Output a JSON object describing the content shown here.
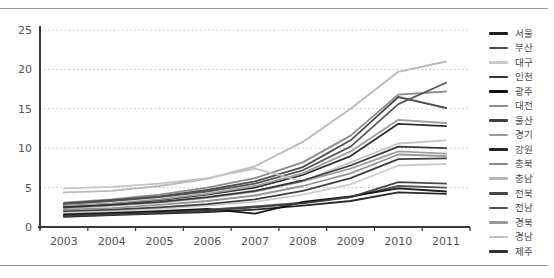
{
  "page": {
    "background": "#ffffff",
    "top_rule_color": "#9a9a9a",
    "bottom_rule_color": "#8d8d8d",
    "axis_color": "#3a3a3a",
    "gridline_color": "#c3c3c3",
    "tick_label_color": "#555555"
  },
  "chart_data": {
    "type": "line",
    "title": "",
    "xlabel": "",
    "ylabel": "",
    "x": [
      "2003",
      "2004",
      "2005",
      "2006",
      "2007",
      "2008",
      "2009",
      "2010",
      "2011"
    ],
    "ylim": [
      0,
      25
    ],
    "yticks": [
      "0",
      "5",
      "10",
      "15",
      "20",
      "25"
    ],
    "grid": "horizontal-dotted",
    "legend_position": "right",
    "series": [
      {
        "id": "seoul",
        "name": "서울",
        "color": "#1f1f1f",
        "values": [
          1.3,
          1.5,
          1.7,
          1.9,
          2.2,
          2.7,
          3.3,
          4.4,
          4.2
        ]
      },
      {
        "id": "busan",
        "name": "부산",
        "color": "#4a4a4a",
        "values": [
          1.5,
          1.7,
          1.9,
          2.2,
          2.6,
          3.1,
          3.8,
          5.2,
          5.0
        ]
      },
      {
        "id": "daegu",
        "name": "대구",
        "color": "#c9c9c9",
        "values": [
          1.8,
          2.0,
          2.3,
          2.7,
          3.2,
          4.1,
          5.4,
          7.8,
          8.0
        ]
      },
      {
        "id": "incheon",
        "name": "인천",
        "color": "#353535",
        "values": [
          2.0,
          2.2,
          2.5,
          2.9,
          3.5,
          4.6,
          6.2,
          8.6,
          8.7
        ]
      },
      {
        "id": "gwangju",
        "name": "광주",
        "color": "#101010",
        "values": [
          1.6,
          1.8,
          2.0,
          2.3,
          1.7,
          3.2,
          3.9,
          4.9,
          4.5
        ]
      },
      {
        "id": "daejeon",
        "name": "대전",
        "color": "#8f8f8f",
        "values": [
          2.2,
          2.4,
          2.8,
          3.3,
          4.0,
          5.2,
          6.8,
          9.2,
          9.0
        ]
      },
      {
        "id": "ulsan",
        "name": "울산",
        "color": "#3d3d3d",
        "values": [
          1.4,
          1.6,
          1.8,
          2.1,
          2.5,
          3.0,
          3.8,
          5.7,
          5.5
        ]
      },
      {
        "id": "gyeonggi",
        "name": "경기",
        "color": "#9a9a9a",
        "values": [
          2.4,
          2.7,
          3.1,
          3.7,
          4.5,
          5.8,
          7.4,
          9.6,
          9.3
        ]
      },
      {
        "id": "gangwon",
        "name": "강원",
        "color": "#242424",
        "values": [
          2.6,
          2.9,
          3.4,
          4.1,
          5.0,
          6.6,
          9.0,
          13.1,
          12.8
        ]
      },
      {
        "id": "chungbuk",
        "name": "충북",
        "color": "#878787",
        "values": [
          3.1,
          3.5,
          4.1,
          5.0,
          6.2,
          8.2,
          11.6,
          16.8,
          17.2
        ]
      },
      {
        "id": "chungnam",
        "name": "충남",
        "color": "#b5b5b5",
        "values": [
          4.4,
          4.6,
          5.2,
          6.1,
          7.7,
          10.8,
          15.0,
          19.7,
          21.0
        ]
      },
      {
        "id": "jeonbuk",
        "name": "전북",
        "color": "#474747",
        "values": [
          3.0,
          3.4,
          3.9,
          4.7,
          5.8,
          7.6,
          11.0,
          16.5,
          15.1
        ]
      },
      {
        "id": "jeonnam",
        "name": "전남",
        "color": "#4f4f4f",
        "values": [
          2.9,
          3.3,
          3.8,
          4.5,
          5.5,
          7.2,
          10.2,
          15.6,
          18.3
        ]
      },
      {
        "id": "gyeongbuk",
        "name": "경북",
        "color": "#999999",
        "values": [
          2.7,
          3.0,
          3.5,
          4.2,
          5.2,
          6.8,
          9.6,
          13.6,
          13.2
        ]
      },
      {
        "id": "gyeongnam",
        "name": "경남",
        "color": "#c2c2c2",
        "values": [
          4.9,
          5.1,
          5.5,
          6.2,
          7.4,
          5.8,
          8.2,
          10.6,
          11.0
        ]
      },
      {
        "id": "jeju",
        "name": "제주",
        "color": "#303030",
        "values": [
          2.5,
          2.8,
          3.2,
          3.8,
          4.6,
          5.9,
          7.8,
          10.2,
          10.0
        ]
      }
    ]
  }
}
